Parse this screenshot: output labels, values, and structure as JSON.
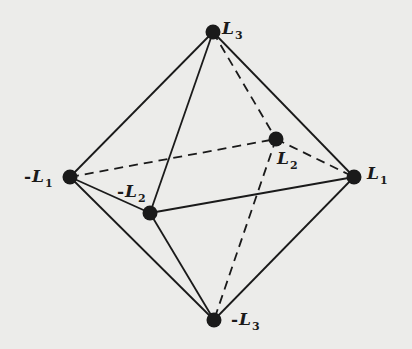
{
  "diagram": {
    "type": "octahedron",
    "background_color": "#ececea",
    "line_color": "#1a1a1a",
    "nodes": [
      {
        "id": "L3",
        "sign": "",
        "symbol": "L",
        "subscript": "3",
        "x": 213,
        "y": 32,
        "label_x": 222,
        "label_y": 20
      },
      {
        "id": "-L1",
        "sign": "-",
        "symbol": "L",
        "subscript": "1",
        "x": 70,
        "y": 177,
        "label_x": 24,
        "label_y": 168
      },
      {
        "id": "L1",
        "sign": "",
        "symbol": "L",
        "subscript": "1",
        "x": 354,
        "y": 177,
        "label_x": 367,
        "label_y": 165
      },
      {
        "id": "-L2",
        "sign": "-",
        "symbol": "L",
        "subscript": "2",
        "x": 150,
        "y": 213,
        "label_x": 117,
        "label_y": 183
      },
      {
        "id": "L2",
        "sign": "",
        "symbol": "L",
        "subscript": "2",
        "x": 276,
        "y": 139,
        "label_x": 277,
        "label_y": 150
      },
      {
        "id": "-L3",
        "sign": "-",
        "symbol": "L",
        "subscript": "3",
        "x": 214,
        "y": 320,
        "label_x": 231,
        "label_y": 311
      }
    ],
    "edges": [
      {
        "from": "L3",
        "to": "-L1",
        "style": "solid"
      },
      {
        "from": "L3",
        "to": "-L2",
        "style": "solid"
      },
      {
        "from": "L3",
        "to": "L1",
        "style": "solid"
      },
      {
        "from": "L3",
        "to": "L2",
        "style": "dashed"
      },
      {
        "from": "-L1",
        "to": "-L2",
        "style": "solid"
      },
      {
        "from": "-L1",
        "to": "L2",
        "style": "dashed"
      },
      {
        "from": "-L2",
        "to": "L1",
        "style": "solid"
      },
      {
        "from": "L2",
        "to": "L1",
        "style": "dashed"
      },
      {
        "from": "-L1",
        "to": "-L3",
        "style": "solid"
      },
      {
        "from": "-L2",
        "to": "-L3",
        "style": "solid"
      },
      {
        "from": "L1",
        "to": "-L3",
        "style": "solid"
      },
      {
        "from": "L2",
        "to": "-L3",
        "style": "dashed"
      }
    ]
  }
}
